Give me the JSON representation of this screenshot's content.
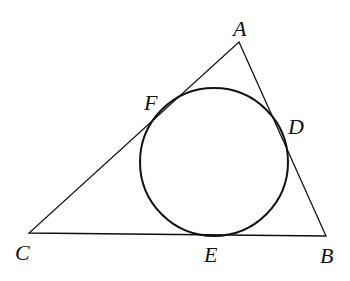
{
  "diagram": {
    "type": "triangle-with-incircle",
    "stroke_color": "#111111",
    "background": "#ffffff",
    "vertices": {
      "A": {
        "label": "A",
        "x": 239,
        "y": 42
      },
      "B": {
        "label": "B",
        "x": 326,
        "y": 236
      },
      "C": {
        "label": "C",
        "x": 29,
        "y": 233
      }
    },
    "incircle": {
      "cx": 214,
      "cy": 162,
      "r": 74
    },
    "tangent_points": {
      "D": {
        "label": "D",
        "on": "AB"
      },
      "E": {
        "label": "E",
        "on": "BC"
      },
      "F": {
        "label": "F",
        "on": "AC"
      }
    },
    "labels": {
      "A": "A",
      "B": "B",
      "C": "C",
      "D": "D",
      "E": "E",
      "F": "F"
    }
  }
}
